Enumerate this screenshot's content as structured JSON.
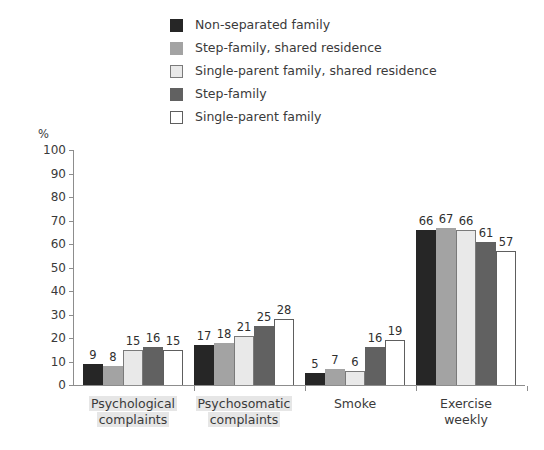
{
  "chart_data": {
    "type": "bar",
    "title": "",
    "subtitle": "",
    "xlabel": "",
    "ylabel": "%",
    "ylim": [
      0,
      100
    ],
    "yticks": [
      0,
      10,
      20,
      30,
      40,
      50,
      60,
      70,
      80,
      90,
      100
    ],
    "grid": false,
    "legend_position": "top",
    "categories": [
      "Psychological complaints",
      "Psychosomatic complaints",
      "Smoke",
      "Exercise weekly"
    ],
    "category_lines": [
      [
        "Psychological",
        "complaints"
      ],
      [
        "Psychosomatic",
        "complaints"
      ],
      [
        "Smoke"
      ],
      [
        "Exercise",
        "weekly"
      ]
    ],
    "category_highlighted": [
      true,
      true,
      false,
      false
    ],
    "series": [
      {
        "name": "Non-separated family",
        "color": "#262626",
        "border": "#262626",
        "values": [
          9,
          17,
          5,
          66
        ]
      },
      {
        "name": "Step-family, shared residence",
        "color": "#a3a3a3",
        "border": "#a3a3a3",
        "values": [
          8,
          18,
          7,
          67
        ]
      },
      {
        "name": "Single-parent family, shared residence",
        "color": "#e9e9e9",
        "border": "#7a7a7a",
        "values": [
          15,
          21,
          6,
          66
        ]
      },
      {
        "name": "Step-family",
        "color": "#616161",
        "border": "#616161",
        "values": [
          16,
          25,
          16,
          61
        ]
      },
      {
        "name": "Single-parent family",
        "color": "#ffffff",
        "border": "#5e5e5e",
        "values": [
          15,
          28,
          19,
          57
        ]
      }
    ]
  }
}
